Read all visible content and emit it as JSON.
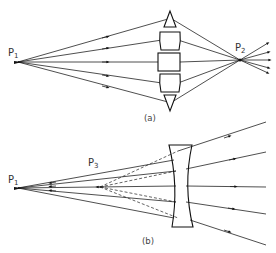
{
  "diagram_a": {
    "caption": "(a)",
    "source_label": "P",
    "source_sub": "1",
    "image_label": "P",
    "image_sub": "2",
    "description": "Segmented (Fresnel-type) converging lens focusing rays from P1 to real image P2"
  },
  "diagram_b": {
    "caption": "(b)",
    "source_label": "P",
    "source_sub": "1",
    "virtual_label": "P",
    "virtual_sub": "3",
    "description": "Diverging (concave) lens; refracted rays appear to emanate from virtual point P3 (dashed)"
  },
  "colors": {
    "line": "#222222",
    "background": "#ffffff"
  }
}
